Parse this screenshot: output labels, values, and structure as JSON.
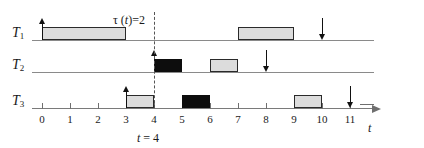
{
  "figure": {
    "kind": "timing-diagram",
    "axis": {
      "name": "t",
      "ticks": [
        "0",
        "1",
        "2",
        "3",
        "4",
        "5",
        "6",
        "7",
        "8",
        "9",
        "10",
        "11"
      ],
      "x_origin_px": 42,
      "x_step_px": 28,
      "min": 0,
      "max": 11
    },
    "annotations": {
      "tau_label": "τ (t)=2",
      "tau_symbol": "τ",
      "tau_arg": "t",
      "tau_value": "2",
      "marker_label": "t = 4",
      "marker_var": "t",
      "marker_value": "4",
      "marker_time": 4
    },
    "rows": [
      {
        "id": "T1",
        "label": "T",
        "sub": "1",
        "baseline_y": 40,
        "blocks": [
          {
            "start": 0,
            "end": 3,
            "fill": "light"
          },
          {
            "start": 7,
            "end": 9,
            "fill": "light"
          }
        ],
        "arrows": [
          {
            "time": 0,
            "dir": "up"
          },
          {
            "time": 10,
            "dir": "down"
          }
        ]
      },
      {
        "id": "T2",
        "label": "T",
        "sub": "2",
        "baseline_y": 72,
        "blocks": [
          {
            "start": 4,
            "end": 5,
            "fill": "dark"
          },
          {
            "start": 6,
            "end": 7,
            "fill": "light"
          }
        ],
        "arrows": [
          {
            "time": 4,
            "dir": "up"
          },
          {
            "time": 8,
            "dir": "down"
          }
        ]
      },
      {
        "id": "T3",
        "label": "T",
        "sub": "3",
        "baseline_y": 108,
        "blocks": [
          {
            "start": 3,
            "end": 4,
            "fill": "light"
          },
          {
            "start": 5,
            "end": 6,
            "fill": "dark"
          },
          {
            "start": 9,
            "end": 10,
            "fill": "light"
          }
        ],
        "arrows": [
          {
            "time": 3,
            "dir": "up"
          },
          {
            "time": 11,
            "dir": "down"
          }
        ]
      }
    ],
    "colors": {
      "light_fill": "#dcdcdc",
      "dark_fill": "#0d0d0d",
      "stroke": "#2a2a2a",
      "axis": "#7a7a7a",
      "text": "#1a1a1a"
    }
  },
  "chart_data": {
    "type": "bar",
    "title": "",
    "xlabel": "t",
    "ylabel": "",
    "xlim": [
      0,
      11
    ],
    "grid": false,
    "legend": null,
    "categories": [
      "T1",
      "T2",
      "T3"
    ],
    "series": [
      {
        "name": "T1",
        "intervals": [
          {
            "start": 0,
            "end": 3,
            "fill": "light"
          },
          {
            "start": 7,
            "end": 9,
            "fill": "light"
          }
        ],
        "release_times": [
          0
        ],
        "deadlines": [
          10
        ]
      },
      {
        "name": "T2",
        "intervals": [
          {
            "start": 4,
            "end": 5,
            "fill": "dark"
          },
          {
            "start": 6,
            "end": 7,
            "fill": "light"
          }
        ],
        "release_times": [
          4
        ],
        "deadlines": [
          8
        ]
      },
      {
        "name": "T3",
        "intervals": [
          {
            "start": 3,
            "end": 4,
            "fill": "light"
          },
          {
            "start": 5,
            "end": 6,
            "fill": "dark"
          },
          {
            "start": 9,
            "end": 10,
            "fill": "light"
          }
        ],
        "release_times": [
          3
        ],
        "deadlines": [
          11
        ]
      }
    ],
    "annotations": [
      {
        "text": "τ (t)=2",
        "at_x": 4.4,
        "kind": "label"
      },
      {
        "text": "t = 4",
        "at_x": 4,
        "kind": "marker-label"
      }
    ],
    "tick_labels": [
      "0",
      "1",
      "2",
      "3",
      "4",
      "5",
      "6",
      "7",
      "8",
      "9",
      "10",
      "11"
    ]
  }
}
